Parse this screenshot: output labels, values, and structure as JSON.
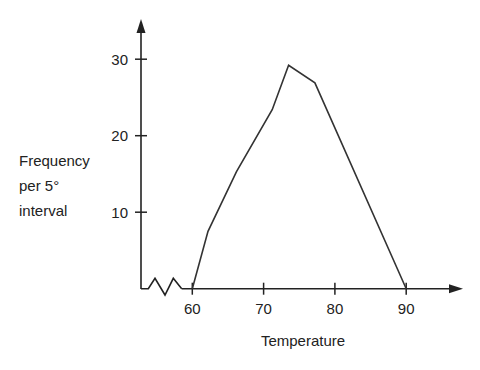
{
  "chart_data": {
    "type": "line",
    "title": "",
    "xlabel": "Temperature",
    "ylabel": "Frequency per 5° interval",
    "ylabel_lines": [
      "Frequency",
      "per 5°",
      "interval"
    ],
    "x": [
      60,
      62.2,
      66.2,
      71.2,
      73.5,
      77.2,
      90
    ],
    "values": [
      0,
      7.5,
      15.3,
      23.4,
      29.2,
      26.9,
      0
    ],
    "xticks": [
      60,
      70,
      80,
      90
    ],
    "yticks": [
      10,
      20,
      30
    ],
    "xlim": [
      53,
      98
    ],
    "ylim": [
      0,
      35
    ],
    "grid": false,
    "legend": "none",
    "x_axis_break": true,
    "line_color": "#333333"
  }
}
